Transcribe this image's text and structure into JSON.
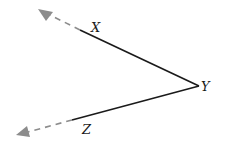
{
  "figure": {
    "type": "angle",
    "vertex": {
      "label": "Y"
    },
    "rays": [
      {
        "id": "ray-yx",
        "point_label": "X",
        "dashed_extension": true,
        "arrow": true
      },
      {
        "id": "ray-yz",
        "point_label": "Z",
        "dashed_extension": true,
        "arrow": true
      }
    ],
    "colors": {
      "solid": "#1a1a1a",
      "dashed": "#8c8c8c",
      "label": "#1a1a1a"
    }
  }
}
